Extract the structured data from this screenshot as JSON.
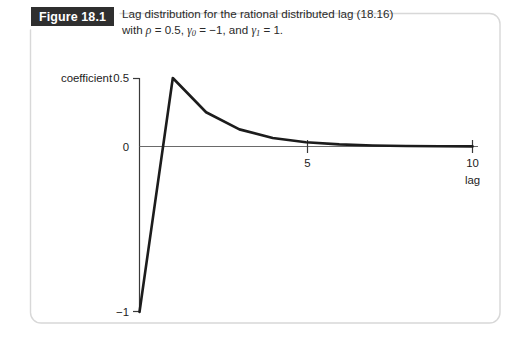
{
  "figure": {
    "badge_label": "Figure 18.1",
    "caption_line1": "Lag distribution for the rational distributed lag (18.16)",
    "caption_line2_prefix": "with ",
    "caption_rho": "ρ",
    "caption_rho_value": " = 0.5, ",
    "caption_gamma0": "γ",
    "caption_gamma0_sub": "0",
    "caption_gamma0_value": " = −1, and ",
    "caption_gamma1": "γ",
    "caption_gamma1_sub": "1",
    "caption_gamma1_value": " = 1.",
    "border_color": "#d8d8d8",
    "badge_bg": "#2f2f2f",
    "badge_fg": "#ffffff",
    "caption_color": "#2a2a2a"
  },
  "chart_data": {
    "type": "line",
    "title": "Lag distribution for the rational distributed lag (18.16) with ρ = 0.5, γ0 = −1, and γ1 = 1.",
    "xlabel": "lag",
    "ylabel": "coefficient",
    "xlim": [
      0,
      10.5
    ],
    "ylim": [
      -1,
      0.5
    ],
    "grid": false,
    "legend": null,
    "x_ticks": [
      5,
      10
    ],
    "x_tick_labels": [
      "5",
      "10"
    ],
    "y_ticks": [
      -1,
      0,
      0.5
    ],
    "y_tick_labels": [
      "−1",
      "0",
      "0.5"
    ],
    "series": [
      {
        "name": "lag coefficient",
        "x": [
          0,
          1,
          2,
          3,
          4,
          5,
          6,
          7,
          8,
          9,
          10
        ],
        "values": [
          -1,
          0.5,
          0.25,
          0.125,
          0.0625,
          0.03125,
          0.015625,
          0.0078125,
          0.00390625,
          0.001953125,
          0.0009765625
        ]
      }
    ],
    "line_color": "#1c1c1c",
    "axis_color": "#3a3a3a",
    "zero_line_color": "#6a6a6a"
  },
  "axis_text": {
    "y_axis_caption": "coefficient",
    "y_top": "0.5",
    "y_zero": "0",
    "y_bottom": "−1",
    "x_tick_5": "5",
    "x_tick_10": "10",
    "x_axis_caption": "lag"
  }
}
